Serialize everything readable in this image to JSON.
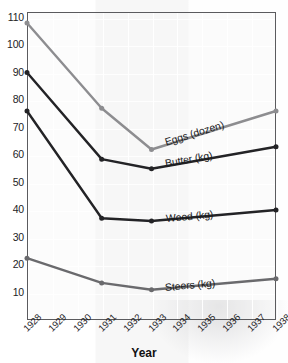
{
  "chart_data": {
    "type": "line",
    "title": "",
    "xlabel": "Year",
    "ylabel": "Cents",
    "x": [
      1928,
      1929,
      1930,
      1931,
      1932,
      1933,
      1934,
      1935,
      1936,
      1937,
      1938
    ],
    "categories": [
      "1928",
      "1929",
      "1930",
      "1931",
      "1932",
      "1933",
      "1934",
      "1935",
      "1936",
      "1937",
      "1938"
    ],
    "xlim": [
      1928,
      1938
    ],
    "ylim": [
      0,
      112
    ],
    "yticks": [
      10,
      20,
      30,
      40,
      50,
      60,
      70,
      80,
      90,
      100,
      110
    ],
    "ytick_labels": [
      "10",
      "20",
      "30",
      "40",
      "50",
      "60",
      "70",
      "80",
      "90",
      "100",
      "110"
    ],
    "grid": true,
    "legend": "inline-annotations",
    "series": [
      {
        "name": "Eggs (dozen)",
        "color": "#8d8d90",
        "marker": "circle",
        "x": [
          1928,
          1931,
          1933,
          1938
        ],
        "values": [
          108,
          77,
          62,
          76
        ],
        "label": "Eggs (dozen)"
      },
      {
        "name": "Butter (kg)",
        "color": "#232326",
        "marker": "circle",
        "x": [
          1928,
          1931,
          1933,
          1938
        ],
        "values": [
          90,
          58.5,
          55,
          63
        ],
        "label": "Butter (kg)"
      },
      {
        "name": "Wood (kg)",
        "color": "#232326",
        "marker": "circle",
        "x": [
          1928,
          1931,
          1933,
          1938
        ],
        "values": [
          76,
          37,
          36,
          40
        ],
        "label": "Wood (kg)"
      },
      {
        "name": "Steers (kg)",
        "color": "#6a6a6d",
        "marker": "circle",
        "x": [
          1928,
          1931,
          1933,
          1938
        ],
        "values": [
          22.5,
          13.5,
          11,
          15
        ],
        "label": "Steers (kg)"
      }
    ],
    "annotations": [
      {
        "text": "Eggs (dozen)",
        "series": "Eggs (dozen)"
      },
      {
        "text": "Butter (kg)",
        "series": "Butter (kg)"
      },
      {
        "text": "Wood (kg)",
        "series": "Wood (kg)"
      },
      {
        "text": "Steers (kg)",
        "series": "Steers (kg)"
      }
    ]
  },
  "axes": {
    "y_label": "Cents",
    "x_label": "Year",
    "y_ticks": [
      "110",
      "100",
      "90",
      "80",
      "70",
      "60",
      "50",
      "40",
      "30",
      "20",
      "10"
    ],
    "x_ticks": [
      "1928",
      "1929",
      "1930",
      "1931",
      "1932",
      "1933",
      "1934",
      "1935",
      "1936",
      "1937",
      "1938"
    ]
  },
  "labels": {
    "eggs": "Eggs (dozen)",
    "butter": "Butter (kg)",
    "wood": "Wood (kg)",
    "steers": "Steers (kg)"
  },
  "colors": {
    "eggs_line": "#8d8d90",
    "butter_line": "#232326",
    "wood_line": "#232326",
    "steers_line": "#6a6a6d",
    "frame": "#5b5b5e",
    "text": "#1d1d1f"
  }
}
